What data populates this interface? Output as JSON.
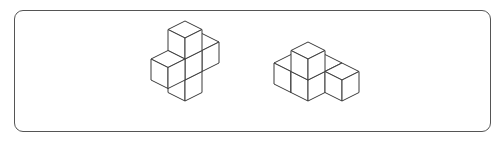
{
  "figure": {
    "stroke_color": "#3a3a3a",
    "frame_color": "#555555",
    "shapes": [
      {
        "name": "cross-shape",
        "origin": [
          185,
          84
        ],
        "unit": {
          "dx": 17,
          "dy": 8.5,
          "h": 21
        },
        "cubes": [
          [
            0,
            0,
            0
          ],
          [
            0,
            0,
            1
          ],
          [
            0,
            -1,
            1
          ],
          [
            0,
            1,
            1
          ],
          [
            0,
            0,
            2
          ]
        ]
      },
      {
        "name": "corner-shape",
        "origin": [
          308,
          84
        ],
        "unit": {
          "dx": 17,
          "dy": 8.5,
          "h": 21
        },
        "cubes": [
          [
            0,
            0,
            0
          ],
          [
            0,
            0,
            1
          ],
          [
            -1,
            0,
            0
          ],
          [
            0,
            -1,
            0
          ],
          [
            1,
            -1,
            0
          ]
        ]
      }
    ]
  }
}
